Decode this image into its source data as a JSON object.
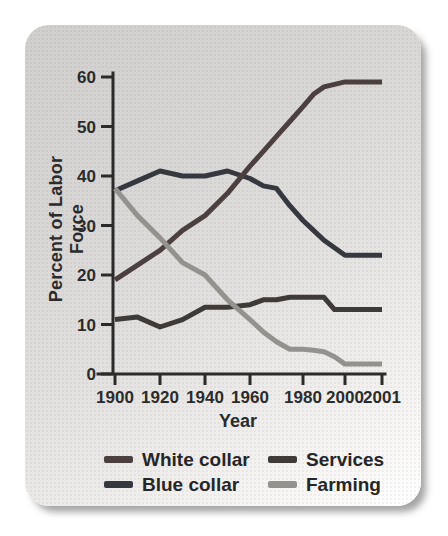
{
  "page": {
    "background": "#ffffff"
  },
  "card": {
    "background_top": "#d1cfcd",
    "background_bottom": "#ffffff",
    "shadow_color": "#9a9a9a"
  },
  "chart_data": {
    "type": "line",
    "title": "",
    "xlabel": "Year",
    "ylabel": "Percent of Labor Force",
    "x_tick_labels": [
      "1900",
      "1920",
      "1940",
      "1960",
      "1980",
      "2000",
      "2001"
    ],
    "y_ticks": [
      0,
      10,
      20,
      30,
      40,
      50,
      60
    ],
    "ylim": [
      0,
      60
    ],
    "xlim": [
      1900,
      2001
    ],
    "grid": false,
    "legend_position": "bottom",
    "axis_color": "#2b2b2b",
    "x": [
      1900,
      1910,
      1920,
      1930,
      1940,
      1950,
      1960,
      1965,
      1970,
      1975,
      1980,
      1985,
      1990,
      1995,
      2000,
      2001
    ],
    "series": [
      {
        "name": "White collar",
        "color": "#4b3f3f",
        "values": [
          19,
          22,
          25,
          29,
          32,
          36.5,
          42,
          45,
          48,
          51,
          54,
          56.5,
          58,
          58.5,
          59,
          59
        ]
      },
      {
        "name": "Blue collar",
        "color": "#363840",
        "values": [
          37,
          39,
          41,
          40,
          40,
          41,
          39.5,
          38,
          37.5,
          34,
          31,
          29,
          27,
          25.5,
          24,
          24
        ]
      },
      {
        "name": "Services",
        "color": "#3e3a37",
        "values": [
          11,
          11.5,
          9.5,
          11,
          13.5,
          13.5,
          14,
          15,
          15,
          15.5,
          15.5,
          15.5,
          15.5,
          13,
          13,
          13
        ]
      },
      {
        "name": "Farming",
        "color": "#94928e",
        "values": [
          37.5,
          32,
          27.5,
          22.5,
          20,
          15,
          11,
          8.5,
          6.5,
          5,
          5,
          4.8,
          4.5,
          3.5,
          2,
          2
        ]
      }
    ]
  }
}
